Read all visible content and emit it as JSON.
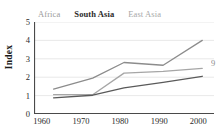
{
  "chart_data": {
    "type": "line",
    "title": "",
    "xlabel": "",
    "ylabel": "Index",
    "x": [
      1960,
      1970,
      1980,
      1990,
      2000
    ],
    "xlim": [
      1958,
      2004
    ],
    "ylim": [
      0,
      5
    ],
    "ytick_labels": [
      "0",
      "1",
      "2",
      "3",
      "4",
      "5"
    ],
    "xtick_labels": [
      "1960",
      "1970",
      "1980",
      "1990",
      "2000"
    ],
    "grid": "horizontal",
    "legend_position": "top",
    "series": [
      {
        "name": "Africa",
        "color": "#a6a6a6",
        "points": [
          [
            1963,
            1.05
          ],
          [
            1973,
            1.05
          ],
          [
            1981,
            2.22
          ],
          [
            1991,
            2.32
          ],
          [
            2001,
            2.48
          ]
        ]
      },
      {
        "name": "South Asia",
        "color": "#5a5a5a",
        "points": [
          [
            1963,
            0.88
          ],
          [
            1973,
            1.02
          ],
          [
            1981,
            1.42
          ],
          [
            1991,
            1.72
          ],
          [
            2001,
            2.05
          ]
        ]
      },
      {
        "name": "East Asia",
        "color": "#8c8c8c",
        "points": [
          [
            1963,
            1.35
          ],
          [
            1973,
            1.95
          ],
          [
            1981,
            2.8
          ],
          [
            1991,
            2.65
          ],
          [
            2001,
            4.0
          ]
        ]
      }
    ]
  },
  "legend": {
    "items": [
      {
        "label": "Africa"
      },
      {
        "label": "South Asia"
      },
      {
        "label": "East Asia"
      }
    ]
  },
  "axes": {
    "y_title": "Index"
  },
  "edge": {
    "clipped_glyph": "9"
  }
}
